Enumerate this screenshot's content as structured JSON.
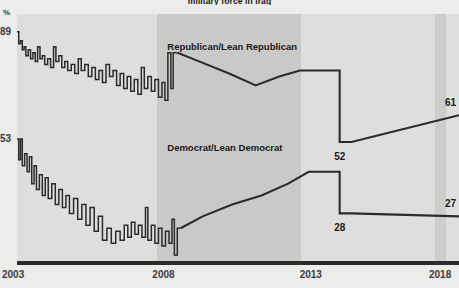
{
  "chart_data": {
    "type": "line",
    "title": "military force in Iraq",
    "xlabel": "",
    "ylabel": "%",
    "xlim": [
      2003,
      2018
    ],
    "ylim": [
      12,
      95
    ],
    "grid": false,
    "legend_position": "inline-annotation",
    "xticks": [
      "2003",
      "2008",
      "2013",
      "2018"
    ],
    "yticks": [
      "89",
      "53"
    ],
    "annotations": [
      {
        "text": "Republican/Lean Republican",
        "x": 2008.1,
        "y": 84
      },
      {
        "text": "Democrat/Lean Democrat",
        "x": 2008.1,
        "y": 50
      },
      {
        "text": "52",
        "x": 2013.9,
        "y": 47
      },
      {
        "text": "28",
        "x": 2013.9,
        "y": 23
      },
      {
        "text": "61",
        "x": 2018.0,
        "y": 65
      },
      {
        "text": "27",
        "x": 2018.0,
        "y": 31
      }
    ],
    "shaded_bands": [
      {
        "from": 2007.75,
        "to": 2012.65,
        "shade": "dark"
      },
      {
        "from": 2017.2,
        "to": 2017.55,
        "shade": "medium"
      }
    ],
    "series": [
      {
        "name": "Republican/Lean Republican",
        "color": "#2b2b2b",
        "endpoint_value": 61,
        "midpoint_value": 52,
        "start_value": 89,
        "points": [
          [
            2003.0,
            89
          ],
          [
            2003.06,
            89
          ],
          [
            2003.06,
            85
          ],
          [
            2003.12,
            85
          ],
          [
            2003.12,
            86
          ],
          [
            2003.18,
            86
          ],
          [
            2003.18,
            83
          ],
          [
            2003.24,
            83
          ],
          [
            2003.24,
            84
          ],
          [
            2003.3,
            84
          ],
          [
            2003.3,
            81
          ],
          [
            2003.38,
            81
          ],
          [
            2003.38,
            83
          ],
          [
            2003.46,
            83
          ],
          [
            2003.46,
            80
          ],
          [
            2003.54,
            80
          ],
          [
            2003.54,
            82
          ],
          [
            2003.62,
            82
          ],
          [
            2003.62,
            79
          ],
          [
            2003.7,
            79
          ],
          [
            2003.7,
            84
          ],
          [
            2003.78,
            84
          ],
          [
            2003.78,
            80
          ],
          [
            2003.86,
            80
          ],
          [
            2003.86,
            81
          ],
          [
            2003.94,
            81
          ],
          [
            2003.94,
            78
          ],
          [
            2004.04,
            78
          ],
          [
            2004.04,
            80
          ],
          [
            2004.14,
            80
          ],
          [
            2004.14,
            77
          ],
          [
            2004.24,
            77
          ],
          [
            2004.24,
            84
          ],
          [
            2004.32,
            84
          ],
          [
            2004.32,
            79
          ],
          [
            2004.42,
            79
          ],
          [
            2004.42,
            81
          ],
          [
            2004.52,
            81
          ],
          [
            2004.52,
            77
          ],
          [
            2004.62,
            77
          ],
          [
            2004.62,
            79
          ],
          [
            2004.72,
            79
          ],
          [
            2004.72,
            76
          ],
          [
            2004.84,
            76
          ],
          [
            2004.84,
            78
          ],
          [
            2004.96,
            78
          ],
          [
            2004.96,
            75
          ],
          [
            2005.08,
            75
          ],
          [
            2005.08,
            80
          ],
          [
            2005.18,
            80
          ],
          [
            2005.18,
            76
          ],
          [
            2005.3,
            76
          ],
          [
            2005.3,
            78
          ],
          [
            2005.42,
            78
          ],
          [
            2005.42,
            74
          ],
          [
            2005.54,
            74
          ],
          [
            2005.54,
            77
          ],
          [
            2005.66,
            77
          ],
          [
            2005.66,
            73
          ],
          [
            2005.78,
            73
          ],
          [
            2005.78,
            76
          ],
          [
            2005.9,
            76
          ],
          [
            2005.9,
            72
          ],
          [
            2006.02,
            72
          ],
          [
            2006.02,
            78
          ],
          [
            2006.14,
            78
          ],
          [
            2006.14,
            74
          ],
          [
            2006.26,
            74
          ],
          [
            2006.26,
            76
          ],
          [
            2006.38,
            76
          ],
          [
            2006.38,
            71
          ],
          [
            2006.5,
            71
          ],
          [
            2006.5,
            75
          ],
          [
            2006.62,
            75
          ],
          [
            2006.62,
            70
          ],
          [
            2006.74,
            70
          ],
          [
            2006.74,
            74
          ],
          [
            2006.86,
            74
          ],
          [
            2006.86,
            69
          ],
          [
            2006.98,
            69
          ],
          [
            2006.98,
            73
          ],
          [
            2007.1,
            73
          ],
          [
            2007.1,
            68
          ],
          [
            2007.22,
            68
          ],
          [
            2007.22,
            77
          ],
          [
            2007.32,
            77
          ],
          [
            2007.32,
            70
          ],
          [
            2007.44,
            70
          ],
          [
            2007.44,
            74
          ],
          [
            2007.56,
            74
          ],
          [
            2007.56,
            69
          ],
          [
            2007.68,
            69
          ],
          [
            2007.68,
            73
          ],
          [
            2007.8,
            73
          ],
          [
            2007.8,
            67
          ],
          [
            2007.92,
            67
          ],
          [
            2007.92,
            72
          ],
          [
            2008.02,
            72
          ],
          [
            2008.02,
            66
          ],
          [
            2008.12,
            66
          ],
          [
            2008.12,
            82
          ],
          [
            2008.22,
            82
          ],
          [
            2008.22,
            70
          ],
          [
            2008.3,
            70
          ],
          [
            2008.3,
            82
          ],
          [
            2008.45,
            82
          ],
          [
            2009.2,
            79
          ],
          [
            2010.2,
            75
          ],
          [
            2011.1,
            71
          ],
          [
            2011.9,
            74
          ],
          [
            2012.6,
            76
          ],
          [
            2013.3,
            76
          ],
          [
            2013.95,
            76
          ],
          [
            2013.95,
            52
          ],
          [
            2014.35,
            52
          ],
          [
            2018.0,
            61
          ]
        ]
      },
      {
        "name": "Democrat/Lean Democrat",
        "color": "#2b2b2b",
        "endpoint_value": 27,
        "midpoint_value": 28,
        "start_value": 53,
        "points": [
          [
            2003.0,
            53
          ],
          [
            2003.06,
            53
          ],
          [
            2003.06,
            46
          ],
          [
            2003.12,
            46
          ],
          [
            2003.12,
            53
          ],
          [
            2003.18,
            53
          ],
          [
            2003.18,
            44
          ],
          [
            2003.26,
            44
          ],
          [
            2003.26,
            48
          ],
          [
            2003.34,
            48
          ],
          [
            2003.34,
            42
          ],
          [
            2003.42,
            42
          ],
          [
            2003.42,
            47
          ],
          [
            2003.5,
            47
          ],
          [
            2003.5,
            38
          ],
          [
            2003.58,
            38
          ],
          [
            2003.58,
            44
          ],
          [
            2003.66,
            44
          ],
          [
            2003.66,
            36
          ],
          [
            2003.76,
            36
          ],
          [
            2003.76,
            41
          ],
          [
            2003.86,
            41
          ],
          [
            2003.86,
            34
          ],
          [
            2003.96,
            34
          ],
          [
            2003.96,
            40
          ],
          [
            2004.06,
            40
          ],
          [
            2004.06,
            33
          ],
          [
            2004.18,
            33
          ],
          [
            2004.18,
            38
          ],
          [
            2004.3,
            38
          ],
          [
            2004.3,
            31
          ],
          [
            2004.42,
            31
          ],
          [
            2004.42,
            36
          ],
          [
            2004.54,
            36
          ],
          [
            2004.54,
            30
          ],
          [
            2004.66,
            30
          ],
          [
            2004.66,
            34
          ],
          [
            2004.78,
            34
          ],
          [
            2004.78,
            28
          ],
          [
            2004.92,
            28
          ],
          [
            2004.92,
            33
          ],
          [
            2005.06,
            33
          ],
          [
            2005.06,
            26
          ],
          [
            2005.2,
            26
          ],
          [
            2005.2,
            31
          ],
          [
            2005.34,
            31
          ],
          [
            2005.34,
            24
          ],
          [
            2005.48,
            24
          ],
          [
            2005.48,
            30
          ],
          [
            2005.62,
            30
          ],
          [
            2005.62,
            22
          ],
          [
            2005.76,
            22
          ],
          [
            2005.76,
            27
          ],
          [
            2005.9,
            27
          ],
          [
            2005.9,
            19
          ],
          [
            2006.05,
            19
          ],
          [
            2006.05,
            23
          ],
          [
            2006.2,
            23
          ],
          [
            2006.2,
            18
          ],
          [
            2006.35,
            18
          ],
          [
            2006.35,
            22
          ],
          [
            2006.5,
            22
          ],
          [
            2006.5,
            19
          ],
          [
            2006.64,
            19
          ],
          [
            2006.64,
            24
          ],
          [
            2006.76,
            24
          ],
          [
            2006.76,
            20
          ],
          [
            2006.88,
            20
          ],
          [
            2006.88,
            25
          ],
          [
            2007.0,
            25
          ],
          [
            2007.0,
            21
          ],
          [
            2007.12,
            21
          ],
          [
            2007.12,
            24
          ],
          [
            2007.24,
            24
          ],
          [
            2007.24,
            20
          ],
          [
            2007.36,
            20
          ],
          [
            2007.36,
            30
          ],
          [
            2007.44,
            30
          ],
          [
            2007.44,
            19
          ],
          [
            2007.56,
            19
          ],
          [
            2007.56,
            24
          ],
          [
            2007.68,
            24
          ],
          [
            2007.68,
            18
          ],
          [
            2007.8,
            18
          ],
          [
            2007.8,
            23
          ],
          [
            2007.92,
            23
          ],
          [
            2007.92,
            17
          ],
          [
            2008.04,
            17
          ],
          [
            2008.04,
            22
          ],
          [
            2008.16,
            22
          ],
          [
            2008.16,
            18
          ],
          [
            2008.26,
            18
          ],
          [
            2008.26,
            26
          ],
          [
            2008.34,
            26
          ],
          [
            2008.34,
            14
          ],
          [
            2008.44,
            14
          ],
          [
            2008.44,
            23
          ],
          [
            2008.55,
            23
          ],
          [
            2009.3,
            27
          ],
          [
            2010.3,
            31
          ],
          [
            2011.3,
            34
          ],
          [
            2012.2,
            38
          ],
          [
            2012.9,
            42
          ],
          [
            2013.4,
            42
          ],
          [
            2013.95,
            42
          ],
          [
            2013.95,
            28
          ],
          [
            2014.35,
            28
          ],
          [
            2018.0,
            27
          ]
        ]
      }
    ]
  },
  "axis": {
    "y_top_label": "89",
    "y_mid_label": "53",
    "y_unit": "%",
    "x_labels": [
      "2003",
      "2008",
      "2013",
      "2018"
    ]
  },
  "labels": {
    "republican": "Republican/Lean Republican",
    "democrat": "Democrat/Lean Democrat",
    "rep_mid": "52",
    "dem_mid": "28",
    "rep_end": "61",
    "dem_end": "27"
  },
  "colors": {
    "line": "#2b2b2b",
    "plot_bg": "#dededc",
    "band_dark": "#c9c9c7",
    "band_right": "#cdcdcb",
    "page_bg": "#ececeb",
    "text": "#1a1a1a"
  }
}
